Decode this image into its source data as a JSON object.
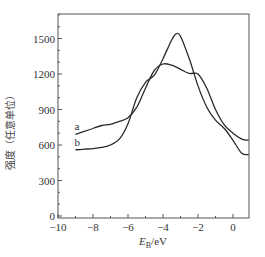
{
  "chart_data": {
    "type": "line",
    "title": "",
    "xlabel": "E_B/eV",
    "xlabel_main": "E",
    "xlabel_sub": "B",
    "xlabel_unit": "/eV",
    "ylabel": "强度（任意单位）",
    "xlim": [
      -10,
      0.9
    ],
    "ylim": [
      0,
      1720
    ],
    "grid": false,
    "legend": "inline labels near left end of curves",
    "x_ticks": [
      -10,
      -8,
      -6,
      -4,
      -2,
      0
    ],
    "x_tick_labels": [
      "−10",
      "−8",
      "−6",
      "−4",
      "−2",
      "0"
    ],
    "y_ticks": [
      0,
      300,
      600,
      900,
      1200,
      1500
    ],
    "y_tick_labels": [
      "0",
      "300",
      "600",
      "900",
      "1200",
      "1500"
    ],
    "series": [
      {
        "name": "a",
        "x": [
          -9.0,
          -8.5,
          -8.0,
          -7.5,
          -7.0,
          -6.5,
          -6.0,
          -5.5,
          -5.0,
          -4.5,
          -4.0,
          -3.5,
          -3.0,
          -2.5,
          -2.0,
          -1.5,
          -1.0,
          -0.5,
          0.0,
          0.5,
          0.9
        ],
        "y": [
          690,
          715,
          740,
          765,
          775,
          800,
          830,
          920,
          1080,
          1230,
          1285,
          1275,
          1240,
          1205,
          1200,
          1080,
          900,
          770,
          700,
          650,
          640
        ]
      },
      {
        "name": "b",
        "x": [
          -9.0,
          -8.5,
          -8.0,
          -7.5,
          -7.0,
          -6.5,
          -6.0,
          -5.5,
          -5.0,
          -4.5,
          -4.0,
          -3.5,
          -3.25,
          -3.0,
          -2.5,
          -2.0,
          -1.5,
          -1.0,
          -0.5,
          0.0,
          0.5,
          0.9
        ],
        "y": [
          560,
          565,
          570,
          580,
          600,
          650,
          780,
          1000,
          1130,
          1190,
          1330,
          1490,
          1540,
          1520,
          1330,
          1100,
          920,
          810,
          740,
          640,
          530,
          520
        ]
      }
    ]
  }
}
